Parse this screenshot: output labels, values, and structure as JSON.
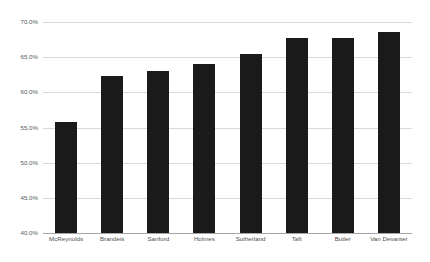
{
  "chart_data": {
    "type": "bar",
    "title": "",
    "subtitle": "",
    "xlabel": "",
    "ylabel": "",
    "categories": [
      "McReynolds",
      "Brandeis",
      "Sanford",
      "Holmes",
      "Sutherland",
      "Taft",
      "Butler",
      "Van Devanter"
    ],
    "values": [
      55.8,
      62.4,
      63.0,
      64.0,
      65.4,
      67.8,
      67.8,
      68.6
    ],
    "ylim": [
      40.0,
      70.0
    ],
    "y_tick_labels": [
      "70.0%",
      "65.0%",
      "60.0%",
      "55.0%",
      "50.0%",
      "45.0%",
      "40.0%"
    ],
    "y_tick_values": [
      70.0,
      65.0,
      60.0,
      55.0,
      50.0,
      45.0,
      40.0
    ],
    "grid": true,
    "legend": "none",
    "bar_color": "#1a1a1a",
    "gridline_color": "#d9d9d9",
    "axis_color": "#a6a6a6",
    "background_color": "#ffffff"
  }
}
